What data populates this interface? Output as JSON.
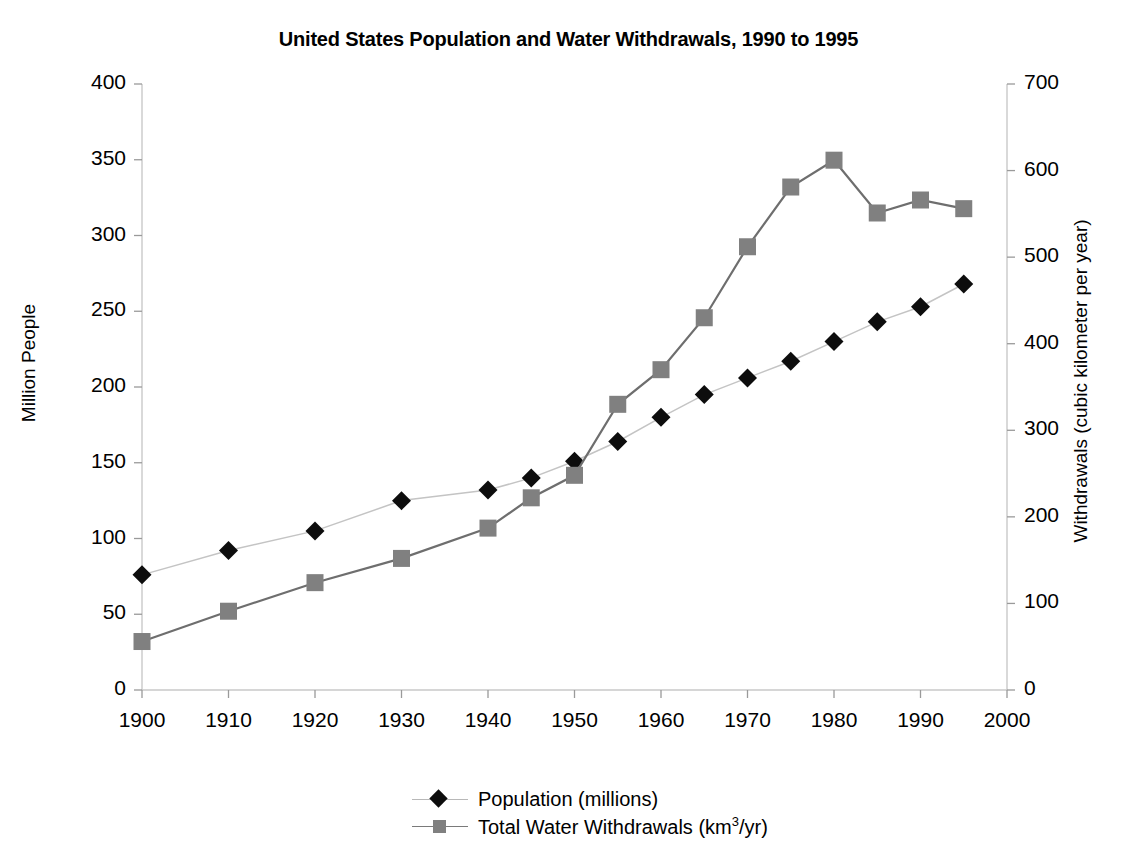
{
  "chart_data": {
    "type": "line",
    "title": "United States Population and Water Withdrawals, 1990 to 1995",
    "xlabel": "",
    "ylabel": "Million People",
    "y2label": "Withdrawals (cubic kilometer per year)",
    "xlim": [
      1900,
      2000
    ],
    "ylim": [
      0,
      400
    ],
    "y2lim": [
      0,
      700
    ],
    "xticks": [
      1900,
      1910,
      1920,
      1930,
      1940,
      1950,
      1960,
      1970,
      1980,
      1990,
      2000
    ],
    "yticks": [
      0,
      50,
      100,
      150,
      200,
      250,
      300,
      350,
      400
    ],
    "y2ticks": [
      0,
      100,
      200,
      300,
      400,
      500,
      600,
      700
    ],
    "grid": false,
    "legend_position": "bottom",
    "series": [
      {
        "name": "Population (millions)",
        "axis": "left",
        "marker": "diamond",
        "color": "#0d0d0d",
        "line_color": "#c4c4c4",
        "x": [
          1900,
          1910,
          1920,
          1930,
          1940,
          1945,
          1950,
          1955,
          1960,
          1965,
          1970,
          1975,
          1980,
          1985,
          1990,
          1995
        ],
        "values": [
          76,
          92,
          105,
          125,
          132,
          140,
          151,
          164,
          180,
          195,
          206,
          217,
          230,
          243,
          253,
          268
        ]
      },
      {
        "name": "Total Water Withdrawals (km3/yr)",
        "axis": "right",
        "marker": "square",
        "color": "#808080",
        "line_color": "#6e6e6e",
        "x": [
          1900,
          1910,
          1920,
          1930,
          1940,
          1945,
          1950,
          1955,
          1960,
          1965,
          1970,
          1975,
          1980,
          1985,
          1990,
          1995
        ],
        "values": [
          56,
          91,
          124,
          152,
          187,
          222,
          248,
          330,
          370,
          430,
          512,
          581,
          612,
          551,
          566,
          556
        ]
      }
    ]
  },
  "legend": {
    "entries": [
      {
        "label": "Population (millions)",
        "marker": "diamond-marker"
      },
      {
        "label_pre": "Total Water Withdrawals (km",
        "label_sup": "3",
        "label_post": "/yr)",
        "marker": "square-marker"
      }
    ]
  }
}
